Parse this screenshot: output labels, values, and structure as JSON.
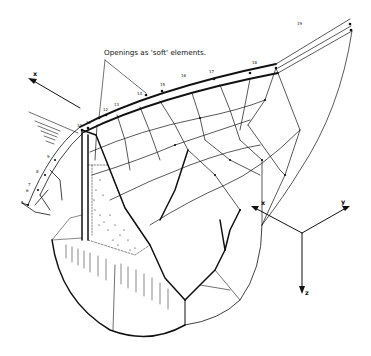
{
  "annotation": "Openings as 'soft' elements.",
  "node_labels": [
    "5",
    "6",
    "7",
    "8",
    "9",
    "10",
    "11",
    "12",
    "13",
    "14",
    "15",
    "16",
    "17",
    "18",
    "19"
  ],
  "upstream_axis_label": "x",
  "triad": {
    "x": "x",
    "y": "y",
    "z": "z"
  },
  "colors": {
    "ink": "#111111",
    "background": "#ffffff"
  }
}
